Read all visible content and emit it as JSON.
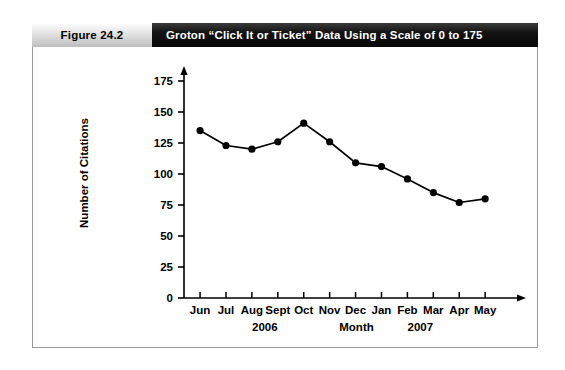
{
  "figure": {
    "number_label": "Figure 24.2",
    "title": "Groton “Click It or Ticket” Data Using a Scale of 0 to 175"
  },
  "chart_data": {
    "type": "line",
    "title": "Groton “Click It or Ticket” Data Using a Scale of 0 to 175",
    "xlabel": "Month",
    "ylabel": "Number of Citations",
    "categories": [
      "Jun",
      "Jul",
      "Aug",
      "Sept",
      "Oct",
      "Nov",
      "Dec",
      "Jan",
      "Feb",
      "Mar",
      "Apr",
      "May"
    ],
    "values": [
      135,
      123,
      120,
      126,
      141,
      126,
      109,
      106,
      96,
      85,
      77,
      80
    ],
    "ylim": [
      0,
      175
    ],
    "yticks": [
      0,
      25,
      50,
      75,
      100,
      125,
      150,
      175
    ],
    "ytick_labels": [
      "0",
      "25",
      "50",
      "75",
      "100",
      "125",
      "150",
      "175"
    ],
    "grid": false,
    "legend": "none",
    "marker": "filled-circle",
    "line_color": "#000000",
    "marker_color": "#000000",
    "year_annotations": [
      {
        "label": "2006",
        "center_category": "Aug"
      },
      {
        "label": "2007",
        "center_category": "Feb"
      }
    ],
    "axis_caption": "Month"
  },
  "colors": {
    "title_bar": "#0a0a0a",
    "figure_number_bg": "#cfcfcf",
    "border": "#9b9b9f",
    "data": "#000000"
  }
}
